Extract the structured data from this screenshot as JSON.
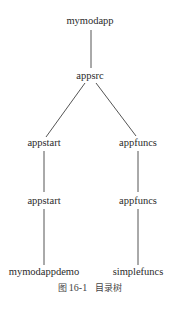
{
  "diagram": {
    "type": "tree",
    "nodes": [
      {
        "id": "root",
        "label": "mymodapp",
        "x": 90,
        "y": 21
      },
      {
        "id": "src",
        "label": "appsrc",
        "x": 90,
        "y": 76
      },
      {
        "id": "start1",
        "label": "appstart",
        "x": 44,
        "y": 143
      },
      {
        "id": "funcs1",
        "label": "appfuncs",
        "x": 138,
        "y": 143
      },
      {
        "id": "start2",
        "label": "appstart",
        "x": 44,
        "y": 201
      },
      {
        "id": "funcs2",
        "label": "appfuncs",
        "x": 138,
        "y": 201
      },
      {
        "id": "demo",
        "label": "mymodappdemo",
        "x": 44,
        "y": 272
      },
      {
        "id": "simple",
        "label": "simplefuncs",
        "x": 138,
        "y": 272
      }
    ],
    "edges": [
      {
        "from": "root",
        "to": "src"
      },
      {
        "from": "src",
        "to": "start1"
      },
      {
        "from": "src",
        "to": "funcs1"
      },
      {
        "from": "start1",
        "to": "start2"
      },
      {
        "from": "funcs1",
        "to": "funcs2"
      },
      {
        "from": "start2",
        "to": "demo"
      },
      {
        "from": "funcs2",
        "to": "simple"
      }
    ],
    "line_color": "#555555"
  },
  "caption": {
    "prefix": "图",
    "number": "16-1",
    "title": "目录树"
  }
}
